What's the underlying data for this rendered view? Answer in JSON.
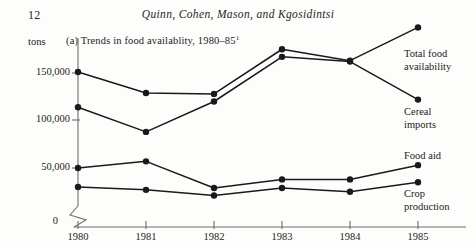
{
  "header": {
    "page_number": "12",
    "running_head": "Quinn, Cohen, Mason, and Kgosidintsi"
  },
  "figure": {
    "units_label": "tons",
    "title": "(a) Trends in food availablity, 1980–85",
    "title_footnote_marker": "1"
  },
  "axis": {
    "y_ticks": [
      "150,000",
      "100,000",
      "50,000",
      "0"
    ],
    "x_ticks": [
      "1980",
      "1981",
      "1982",
      "1983",
      "1984",
      "1985"
    ],
    "break_symbol": "axis-break"
  },
  "legend": {
    "total_food_line1": "Total food",
    "total_food_line2": "availability",
    "cereal_line1": "Cereal",
    "cereal_line2": "imports",
    "food_aid_line1": "Food aid",
    "crop_line1": "Crop",
    "crop_line2": "production"
  },
  "colors": {
    "ink": "#1a1a1a",
    "axis": "#6e6e6e",
    "paper": "#fdfdfb"
  },
  "chart_data": {
    "type": "line",
    "title": "(a) Trends in food availablity, 1980–85",
    "xlabel": "",
    "ylabel": "tons",
    "x": [
      "1980",
      "1981",
      "1982",
      "1983",
      "1984",
      "1985"
    ],
    "ylim": [
      0,
      200000
    ],
    "yticks": [
      0,
      50000,
      100000,
      150000
    ],
    "y_axis_break": true,
    "grid": false,
    "legend_position": "right-inline",
    "markers": "filled-circle",
    "series": [
      {
        "name": "Total food availability",
        "values": [
          151000,
          129000,
          128000,
          175000,
          163000,
          198000
        ]
      },
      {
        "name": "Cereal imports",
        "values": [
          114000,
          88000,
          120000,
          167000,
          162000,
          122000
        ]
      },
      {
        "name": "Food aid",
        "values": [
          50000,
          57000,
          29000,
          38000,
          38000,
          53000
        ]
      },
      {
        "name": "Crop production",
        "values": [
          30000,
          27000,
          21000,
          29000,
          25000,
          35000
        ]
      }
    ]
  }
}
